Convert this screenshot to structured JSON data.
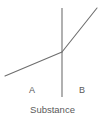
{
  "figure": {
    "background_color": "#ffffff",
    "line_color": "#6e6e6e",
    "divider_color": "#707070",
    "text_color": "#5a5a5a",
    "caption": "Substance",
    "region_a_label": "A",
    "region_b_label": "B"
  },
  "chart_data": {
    "type": "line",
    "title": "",
    "xlabel": "Substance",
    "ylabel": "",
    "grid": false,
    "legend": null,
    "annotations": [
      "A",
      "B",
      "Substance"
    ],
    "series": [
      {
        "name": "region-a-segment",
        "x": [
          5,
          62
        ],
        "y": [
          76,
          52
        ],
        "description": "shallow rising segment in region A"
      },
      {
        "name": "region-b-segment",
        "x": [
          62,
          97
        ],
        "y": [
          52,
          8
        ],
        "description": "steeper rising segment in region B"
      }
    ],
    "divider": {
      "name": "region-divider",
      "x": 62,
      "y_range": [
        8,
        97
      ],
      "orientation": "vertical"
    },
    "regions": [
      {
        "label": "A",
        "x_center": 32,
        "y": 90
      },
      {
        "label": "B",
        "x_center": 82,
        "y": 90
      }
    ]
  }
}
